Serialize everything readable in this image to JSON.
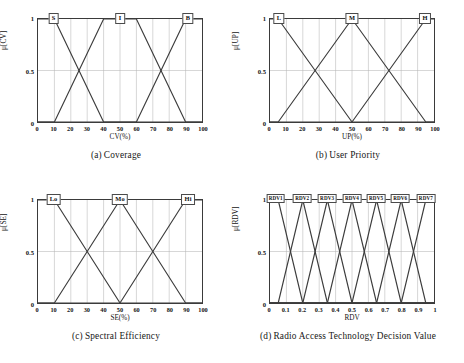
{
  "figure": {
    "panels": [
      {
        "id": "a",
        "caption_label": "(a)",
        "caption_text": "Coverage",
        "xlabel": "CV(%)",
        "ylabel": "μ[CV]",
        "xticks": [
          "0",
          "10",
          "20",
          "30",
          "40",
          "50",
          "60",
          "70",
          "80",
          "90",
          "100"
        ],
        "yticks": [
          "0",
          "0.5",
          "1"
        ],
        "set_labels": [
          "S",
          "I",
          "B"
        ],
        "label_size": "normal"
      },
      {
        "id": "b",
        "caption_label": "(b)",
        "caption_text": "User Priority",
        "xlabel": "UP(%)",
        "ylabel": "μ[UP]",
        "xticks": [
          "0",
          "10",
          "20",
          "30",
          "40",
          "50",
          "60",
          "70",
          "80",
          "90",
          "100"
        ],
        "yticks": [
          "0",
          "0.5",
          "1"
        ],
        "set_labels": [
          "L",
          "M",
          "H"
        ],
        "label_size": "normal"
      },
      {
        "id": "c",
        "caption_label": "(c)",
        "caption_text": "Spectral Efficiency",
        "xlabel": "SE(%)",
        "ylabel": "μ[SE]",
        "xticks": [
          "0",
          "10",
          "20",
          "30",
          "40",
          "50",
          "60",
          "70",
          "80",
          "90",
          "100"
        ],
        "yticks": [
          "0",
          "0.5",
          "1"
        ],
        "set_labels": [
          "Lo",
          "Mo",
          "Hi"
        ],
        "label_size": "normal"
      },
      {
        "id": "d",
        "caption_label": "(d)",
        "caption_text": "Radio Access Technology Decision Value",
        "xlabel": "RDV",
        "ylabel": "μ[RDV]",
        "xticks": [
          "0",
          "0.1",
          "0.2",
          "0.3",
          "0.4",
          "0.5",
          "0.6",
          "0.7",
          "0.8",
          "0.9",
          "1"
        ],
        "yticks": [
          "0",
          "0.5",
          "1"
        ],
        "set_labels": [
          "RDV1",
          "RDV2",
          "RDV3",
          "RDV4",
          "RDV5",
          "RDV6",
          "RDV7"
        ],
        "label_size": "small"
      }
    ]
  },
  "chart_data": [
    {
      "type": "line",
      "panel": "a",
      "title": "(a) Coverage",
      "xlabel": "CV(%)",
      "ylabel": "μ[CV]",
      "xlim": [
        0,
        100
      ],
      "ylim": [
        0,
        1
      ],
      "xticks": [
        0,
        10,
        20,
        30,
        40,
        50,
        60,
        70,
        80,
        90,
        100
      ],
      "yticks": [
        0,
        0.5,
        1
      ],
      "grid": true,
      "legend": "inline-top-labels",
      "series": [
        {
          "name": "S",
          "label_x": 10,
          "points": [
            [
              0,
              1
            ],
            [
              10,
              1
            ],
            [
              40,
              0
            ],
            [
              100,
              0
            ]
          ]
        },
        {
          "name": "I",
          "label_x": 50,
          "points": [
            [
              0,
              0
            ],
            [
              10,
              0
            ],
            [
              40,
              1
            ],
            [
              60,
              1
            ],
            [
              90,
              0
            ],
            [
              100,
              0
            ]
          ]
        },
        {
          "name": "B",
          "label_x": 91,
          "points": [
            [
              0,
              0
            ],
            [
              60,
              0
            ],
            [
              90,
              1
            ],
            [
              100,
              1
            ]
          ]
        }
      ]
    },
    {
      "type": "line",
      "panel": "b",
      "title": "(b) User Priority",
      "xlabel": "UP(%)",
      "ylabel": "μ[UP]",
      "xlim": [
        0,
        100
      ],
      "ylim": [
        0,
        1
      ],
      "xticks": [
        0,
        10,
        20,
        30,
        40,
        50,
        60,
        70,
        80,
        90,
        100
      ],
      "yticks": [
        0,
        0.5,
        1
      ],
      "grid": true,
      "legend": "inline-top-labels",
      "series": [
        {
          "name": "L",
          "label_x": 6,
          "points": [
            [
              0,
              1
            ],
            [
              5,
              1
            ],
            [
              50,
              0
            ],
            [
              100,
              0
            ]
          ]
        },
        {
          "name": "M",
          "label_x": 50,
          "points": [
            [
              0,
              0
            ],
            [
              5,
              0
            ],
            [
              50,
              1
            ],
            [
              95,
              0
            ],
            [
              100,
              0
            ]
          ]
        },
        {
          "name": "H",
          "label_x": 94,
          "points": [
            [
              0,
              0
            ],
            [
              50,
              0
            ],
            [
              95,
              1
            ],
            [
              100,
              1
            ]
          ]
        }
      ]
    },
    {
      "type": "line",
      "panel": "c",
      "title": "(c) Spectral Efficiency",
      "xlabel": "SE(%)",
      "ylabel": "μ[SE]",
      "xlim": [
        0,
        100
      ],
      "ylim": [
        0,
        1
      ],
      "xticks": [
        0,
        10,
        20,
        30,
        40,
        50,
        60,
        70,
        80,
        90,
        100
      ],
      "yticks": [
        0,
        0.5,
        1
      ],
      "grid": true,
      "legend": "inline-top-labels",
      "series": [
        {
          "name": "Lo",
          "label_x": 10,
          "points": [
            [
              0,
              1
            ],
            [
              10,
              1
            ],
            [
              50,
              0
            ],
            [
              100,
              0
            ]
          ]
        },
        {
          "name": "Mo",
          "label_x": 50,
          "points": [
            [
              0,
              0
            ],
            [
              10,
              0
            ],
            [
              50,
              1
            ],
            [
              90,
              0
            ],
            [
              100,
              0
            ]
          ]
        },
        {
          "name": "Hi",
          "label_x": 91,
          "points": [
            [
              0,
              0
            ],
            [
              50,
              0
            ],
            [
              90,
              1
            ],
            [
              100,
              1
            ]
          ]
        }
      ]
    },
    {
      "type": "line",
      "panel": "d",
      "title": "(d) Radio Access Technology Decision Value",
      "xlabel": "RDV",
      "ylabel": "μ[RDV]",
      "xlim": [
        0,
        1
      ],
      "ylim": [
        0,
        1
      ],
      "xticks": [
        0,
        0.1,
        0.2,
        0.3,
        0.4,
        0.5,
        0.6,
        0.7,
        0.8,
        0.9,
        1
      ],
      "yticks": [
        0,
        0.5,
        1
      ],
      "grid": true,
      "legend": "inline-top-labels",
      "series": [
        {
          "name": "RDV1",
          "label_x": 0.04,
          "points": [
            [
              0,
              1
            ],
            [
              0.05,
              1
            ],
            [
              0.2,
              0
            ],
            [
              1,
              0
            ]
          ]
        },
        {
          "name": "RDV2",
          "label_x": 0.2,
          "points": [
            [
              0,
              0
            ],
            [
              0.05,
              0
            ],
            [
              0.2,
              1
            ],
            [
              0.35,
              0
            ],
            [
              1,
              0
            ]
          ]
        },
        {
          "name": "RDV3",
          "label_x": 0.35,
          "points": [
            [
              0,
              0
            ],
            [
              0.2,
              0
            ],
            [
              0.35,
              1
            ],
            [
              0.5,
              0
            ],
            [
              1,
              0
            ]
          ]
        },
        {
          "name": "RDV4",
          "label_x": 0.5,
          "points": [
            [
              0,
              0
            ],
            [
              0.35,
              0
            ],
            [
              0.5,
              1
            ],
            [
              0.65,
              0
            ],
            [
              1,
              0
            ]
          ]
        },
        {
          "name": "RDV5",
          "label_x": 0.645,
          "points": [
            [
              0,
              0
            ],
            [
              0.5,
              0
            ],
            [
              0.65,
              1
            ],
            [
              0.8,
              0
            ],
            [
              1,
              0
            ]
          ]
        },
        {
          "name": "RDV6",
          "label_x": 0.79,
          "points": [
            [
              0,
              0
            ],
            [
              0.65,
              0
            ],
            [
              0.8,
              1
            ],
            [
              0.95,
              0
            ],
            [
              1,
              0
            ]
          ]
        },
        {
          "name": "RDV7",
          "label_x": 0.945,
          "points": [
            [
              0,
              0
            ],
            [
              0.8,
              0
            ],
            [
              0.95,
              1
            ],
            [
              1,
              1
            ]
          ]
        }
      ]
    }
  ],
  "colors": {
    "line": "#3c3c3c",
    "grid": "#b4b4b4",
    "axis": "#3a3a3a",
    "text": "#141414",
    "background": "#ffffff"
  }
}
